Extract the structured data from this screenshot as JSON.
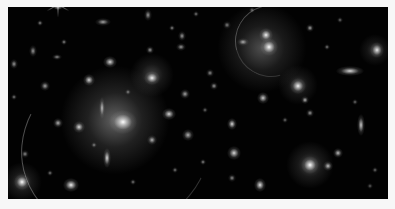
{
  "image": {
    "subject": "galaxy cluster with gravitational lensing arcs",
    "palette": {
      "background": "#020202",
      "frame": "#f7f7f7",
      "glow": "#ffffff"
    },
    "frame": {
      "x": 8,
      "y": 7,
      "w": 380,
      "h": 192
    },
    "halos": [
      {
        "x": 115,
        "y": 120,
        "r": 55,
        "a": 0.38
      },
      {
        "x": 262,
        "y": 48,
        "r": 45,
        "a": 0.3
      },
      {
        "x": 152,
        "y": 75,
        "r": 22,
        "a": 0.25
      },
      {
        "x": 310,
        "y": 165,
        "r": 24,
        "a": 0.28
      },
      {
        "x": 298,
        "y": 85,
        "r": 20,
        "a": 0.22
      },
      {
        "x": 22,
        "y": 182,
        "r": 20,
        "a": 0.25
      },
      {
        "x": 375,
        "y": 50,
        "r": 16,
        "a": 0.22
      }
    ],
    "galaxies": [
      {
        "x": 123,
        "y": 122,
        "w": 14,
        "h": 12,
        "a": 1.0
      },
      {
        "x": 269,
        "y": 47,
        "w": 9,
        "h": 9,
        "a": 1.0
      },
      {
        "x": 266,
        "y": 35,
        "w": 7,
        "h": 7,
        "a": 0.95
      },
      {
        "x": 152,
        "y": 78,
        "w": 8,
        "h": 7,
        "a": 0.95
      },
      {
        "x": 310,
        "y": 165,
        "w": 9,
        "h": 9,
        "a": 1.0
      },
      {
        "x": 298,
        "y": 86,
        "w": 8,
        "h": 8,
        "a": 0.95
      },
      {
        "x": 22,
        "y": 182,
        "w": 8,
        "h": 8,
        "a": 1.0
      },
      {
        "x": 71,
        "y": 185,
        "w": 8,
        "h": 7,
        "a": 0.95
      },
      {
        "x": 110,
        "y": 62,
        "w": 7,
        "h": 6,
        "a": 0.85
      },
      {
        "x": 89,
        "y": 80,
        "w": 6,
        "h": 6,
        "a": 0.85
      },
      {
        "x": 79,
        "y": 127,
        "w": 6,
        "h": 6,
        "a": 0.85
      },
      {
        "x": 169,
        "y": 114,
        "w": 7,
        "h": 6,
        "a": 0.85
      },
      {
        "x": 152,
        "y": 140,
        "w": 5,
        "h": 5,
        "a": 0.7
      },
      {
        "x": 107,
        "y": 158,
        "w": 4,
        "h": 10,
        "a": 0.85
      },
      {
        "x": 102,
        "y": 108,
        "w": 3,
        "h": 11,
        "a": 0.7
      },
      {
        "x": 234,
        "y": 153,
        "w": 7,
        "h": 7,
        "a": 0.85
      },
      {
        "x": 260,
        "y": 185,
        "w": 6,
        "h": 7,
        "a": 0.9
      },
      {
        "x": 232,
        "y": 124,
        "w": 5,
        "h": 6,
        "a": 0.85
      },
      {
        "x": 263,
        "y": 98,
        "w": 6,
        "h": 6,
        "a": 0.8
      },
      {
        "x": 350,
        "y": 71,
        "w": 14,
        "h": 5,
        "a": 0.85
      },
      {
        "x": 377,
        "y": 50,
        "w": 7,
        "h": 8,
        "a": 0.9
      },
      {
        "x": 361,
        "y": 125,
        "w": 4,
        "h": 11,
        "a": 0.8
      },
      {
        "x": 338,
        "y": 153,
        "w": 5,
        "h": 5,
        "a": 0.75
      },
      {
        "x": 328,
        "y": 166,
        "w": 5,
        "h": 5,
        "a": 0.75
      },
      {
        "x": 305,
        "y": 100,
        "w": 4,
        "h": 4,
        "a": 0.7
      },
      {
        "x": 310,
        "y": 28,
        "w": 4,
        "h": 4,
        "a": 0.65
      },
      {
        "x": 310,
        "y": 113,
        "w": 4,
        "h": 4,
        "a": 0.6
      },
      {
        "x": 203,
        "y": 162,
        "w": 3,
        "h": 3,
        "a": 0.55
      },
      {
        "x": 188,
        "y": 135,
        "w": 6,
        "h": 6,
        "a": 0.7
      },
      {
        "x": 185,
        "y": 94,
        "w": 5,
        "h": 5,
        "a": 0.65
      },
      {
        "x": 214,
        "y": 86,
        "w": 4,
        "h": 4,
        "a": 0.6
      },
      {
        "x": 182,
        "y": 36,
        "w": 4,
        "h": 5,
        "a": 0.6
      },
      {
        "x": 172,
        "y": 28,
        "w": 3,
        "h": 3,
        "a": 0.55
      },
      {
        "x": 150,
        "y": 50,
        "w": 4,
        "h": 4,
        "a": 0.6
      },
      {
        "x": 181,
        "y": 47,
        "w": 5,
        "h": 4,
        "a": 0.6
      },
      {
        "x": 103,
        "y": 22,
        "w": 8,
        "h": 4,
        "a": 0.65
      },
      {
        "x": 64,
        "y": 42,
        "w": 3,
        "h": 3,
        "a": 0.55
      },
      {
        "x": 40,
        "y": 23,
        "w": 3,
        "h": 3,
        "a": 0.55
      },
      {
        "x": 33,
        "y": 51,
        "w": 4,
        "h": 6,
        "a": 0.6
      },
      {
        "x": 14,
        "y": 64,
        "w": 4,
        "h": 5,
        "a": 0.6
      },
      {
        "x": 57,
        "y": 57,
        "w": 5,
        "h": 3,
        "a": 0.55
      },
      {
        "x": 45,
        "y": 86,
        "w": 5,
        "h": 5,
        "a": 0.65
      },
      {
        "x": 14,
        "y": 97,
        "w": 3,
        "h": 3,
        "a": 0.5
      },
      {
        "x": 25,
        "y": 154,
        "w": 4,
        "h": 4,
        "a": 0.55
      },
      {
        "x": 58,
        "y": 123,
        "w": 5,
        "h": 5,
        "a": 0.7
      },
      {
        "x": 50,
        "y": 173,
        "w": 3,
        "h": 3,
        "a": 0.5
      },
      {
        "x": 148,
        "y": 15,
        "w": 4,
        "h": 6,
        "a": 0.6
      },
      {
        "x": 227,
        "y": 25,
        "w": 4,
        "h": 4,
        "a": 0.5
      },
      {
        "x": 243,
        "y": 42,
        "w": 6,
        "h": 4,
        "a": 0.65
      },
      {
        "x": 210,
        "y": 73,
        "w": 4,
        "h": 4,
        "a": 0.55
      },
      {
        "x": 327,
        "y": 47,
        "w": 3,
        "h": 3,
        "a": 0.5
      },
      {
        "x": 355,
        "y": 102,
        "w": 3,
        "h": 3,
        "a": 0.45
      },
      {
        "x": 285,
        "y": 120,
        "w": 3,
        "h": 3,
        "a": 0.45
      },
      {
        "x": 232,
        "y": 178,
        "w": 4,
        "h": 4,
        "a": 0.55
      },
      {
        "x": 175,
        "y": 170,
        "w": 3,
        "h": 3,
        "a": 0.5
      },
      {
        "x": 133,
        "y": 182,
        "w": 3,
        "h": 3,
        "a": 0.5
      },
      {
        "x": 94,
        "y": 145,
        "w": 3,
        "h": 3,
        "a": 0.5
      },
      {
        "x": 375,
        "y": 170,
        "w": 3,
        "h": 3,
        "a": 0.45
      },
      {
        "x": 370,
        "y": 186,
        "w": 3,
        "h": 3,
        "a": 0.4
      },
      {
        "x": 205,
        "y": 110,
        "w": 3,
        "h": 3,
        "a": 0.45
      },
      {
        "x": 128,
        "y": 92,
        "w": 3,
        "h": 3,
        "a": 0.5
      },
      {
        "x": 196,
        "y": 14,
        "w": 3,
        "h": 3,
        "a": 0.5
      },
      {
        "x": 252,
        "y": 10,
        "w": 3,
        "h": 3,
        "a": 0.45
      },
      {
        "x": 340,
        "y": 20,
        "w": 3,
        "h": 3,
        "a": 0.45
      }
    ],
    "arcs": [
      {
        "x": 20,
        "y": 60,
        "w": 190,
        "h": 170,
        "rot": -20,
        "a": 0.35
      },
      {
        "x": 235,
        "y": 5,
        "w": 70,
        "h": 70,
        "rot": 30,
        "a": 0.3
      }
    ],
    "star": {
      "x": 58,
      "y": 4,
      "spike_len": 26
    }
  }
}
